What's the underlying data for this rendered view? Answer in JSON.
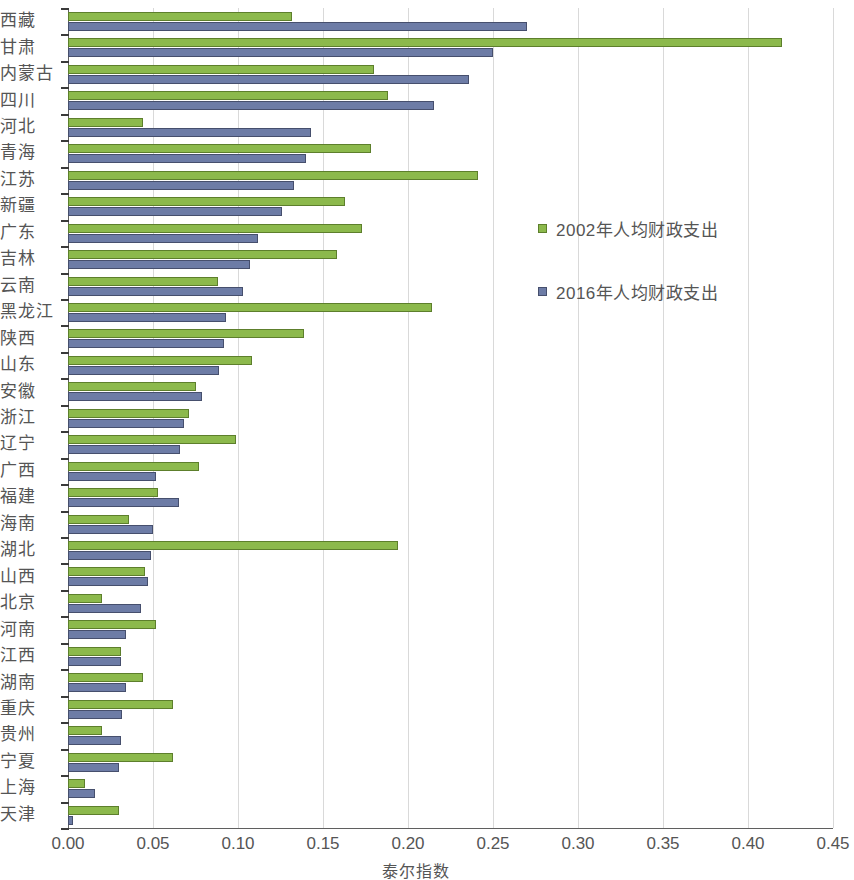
{
  "chart_data": {
    "type": "bar",
    "orientation": "horizontal",
    "title": "",
    "xlabel": "泰尔指数",
    "ylabel": "",
    "xlim": [
      0.0,
      0.45
    ],
    "xticks": [
      "0.00",
      "0.05",
      "0.10",
      "0.15",
      "0.20",
      "0.25",
      "0.30",
      "0.35",
      "0.40",
      "0.45"
    ],
    "grid": "vertical",
    "legend_position": "center-right",
    "colors": {
      "series_a": "#8cb94c",
      "series_b": "#6d7ca6",
      "gridline": "#d9d9d9",
      "axis": "#5f5f5f",
      "text": "#555555"
    },
    "categories": [
      "西藏",
      "甘肃",
      "内蒙古",
      "四川",
      "河北",
      "青海",
      "江苏",
      "新疆",
      "广东",
      "吉林",
      "云南",
      "黑龙江",
      "陕西",
      "山东",
      "安徽",
      "浙江",
      "辽宁",
      "广西",
      "福建",
      "海南",
      "湖北",
      "山西",
      "北京",
      "河南",
      "江西",
      "湖南",
      "重庆",
      "贵州",
      "宁夏",
      "上海",
      "天津"
    ],
    "series": [
      {
        "name": "2002年人均财政支出",
        "color": "#8cb94c",
        "values": [
          0.132,
          0.42,
          0.18,
          0.188,
          0.044,
          0.178,
          0.241,
          0.163,
          0.173,
          0.158,
          0.088,
          0.214,
          0.139,
          0.108,
          0.075,
          0.071,
          0.099,
          0.077,
          0.053,
          0.036,
          0.194,
          0.045,
          0.02,
          0.052,
          0.031,
          0.044,
          0.062,
          0.02,
          0.062,
          0.01,
          0.03
        ]
      },
      {
        "name": "2016年人均财政支出",
        "color": "#6d7ca6",
        "values": [
          0.27,
          0.25,
          0.236,
          0.215,
          0.143,
          0.14,
          0.133,
          0.126,
          0.112,
          0.107,
          0.103,
          0.093,
          0.092,
          0.089,
          0.079,
          0.068,
          0.066,
          0.052,
          0.065,
          0.05,
          0.049,
          0.047,
          0.043,
          0.034,
          0.031,
          0.034,
          0.032,
          0.031,
          0.03,
          0.016,
          0.003
        ]
      }
    ]
  },
  "legend": {
    "items": [
      {
        "label": "2002年人均财政支出",
        "series": "series_a"
      },
      {
        "label": "2016年人均财政支出",
        "series": "series_b"
      }
    ]
  },
  "axis": {
    "x_title": "泰尔指数"
  }
}
